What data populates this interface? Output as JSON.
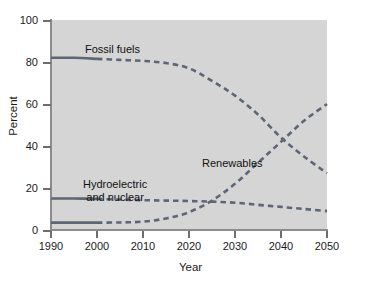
{
  "chart_data": {
    "type": "line",
    "title": "",
    "xlabel": "Year",
    "ylabel": "Percent",
    "xlim": [
      1990,
      2050
    ],
    "ylim": [
      0,
      100
    ],
    "xticks": [
      1990,
      2000,
      2010,
      2020,
      2030,
      2040,
      2050
    ],
    "yticks": [
      0,
      20,
      40,
      60,
      80,
      100
    ],
    "grid": false,
    "legend_position": "inline-annotations",
    "historical_cutoff_year": 2000,
    "x": [
      1990,
      1995,
      2000,
      2005,
      2010,
      2015,
      2020,
      2025,
      2030,
      2035,
      2040,
      2045,
      2050
    ],
    "series": [
      {
        "name": "Fossil fuels",
        "color": "#5d6672",
        "style": "dashed",
        "values": [
          82,
          82,
          81.5,
          81,
          80.5,
          79.5,
          77,
          71,
          64,
          55,
          44,
          35,
          27
        ]
      },
      {
        "name": "Hydroelectric and nuclear",
        "color": "#5d6672",
        "style": "dashed",
        "values": [
          15,
          15,
          14.8,
          14.5,
          14.2,
          14,
          13.8,
          13.5,
          13,
          12,
          11,
          10,
          9
        ]
      },
      {
        "name": "Renewables",
        "color": "#5d6672",
        "style": "dashed",
        "values": [
          3.5,
          3.5,
          3.5,
          3.6,
          4,
          5.5,
          8.5,
          14,
          22,
          32,
          42,
          52,
          60
        ]
      }
    ],
    "annotations": [
      {
        "text": "Fossil fuels",
        "x": 2000,
        "y": 88
      },
      {
        "text_line1": "Hydroelectric",
        "text_line2": "and nuclear",
        "x": 2006,
        "y": 24
      },
      {
        "text": "Renewables",
        "x": 2030,
        "y": 35
      }
    ]
  },
  "axes": {
    "ylabel": "Percent",
    "xlabel": "Year",
    "ytick_labels": [
      "100",
      "80",
      "60",
      "40",
      "20",
      "0"
    ],
    "xtick_labels": [
      "1990",
      "2000",
      "2010",
      "2020",
      "2030",
      "2040",
      "2050"
    ]
  },
  "labels": {
    "fossil": "Fossil fuels",
    "hydro_line1": "Hydroelectric",
    "hydro_line2": "and nuclear",
    "renewables": "Renewables"
  },
  "colors": {
    "plot_background": "#d5d5d5",
    "page_background": "#ffffff",
    "line": "#5d6672",
    "axis": "#8c8c8c",
    "text": "#1a1a1a"
  }
}
